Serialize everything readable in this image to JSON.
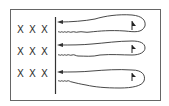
{
  "diagram": {
    "rows": [
      {
        "marks": [
          "X",
          "X",
          "X"
        ],
        "has_flag": true
      },
      {
        "marks": [
          "X",
          "X",
          "X"
        ],
        "has_flag": true
      },
      {
        "marks": [
          "X",
          "X",
          "X"
        ],
        "has_flag": true
      }
    ],
    "colors": {
      "stroke": "#333333",
      "background": "#ffffff"
    }
  }
}
